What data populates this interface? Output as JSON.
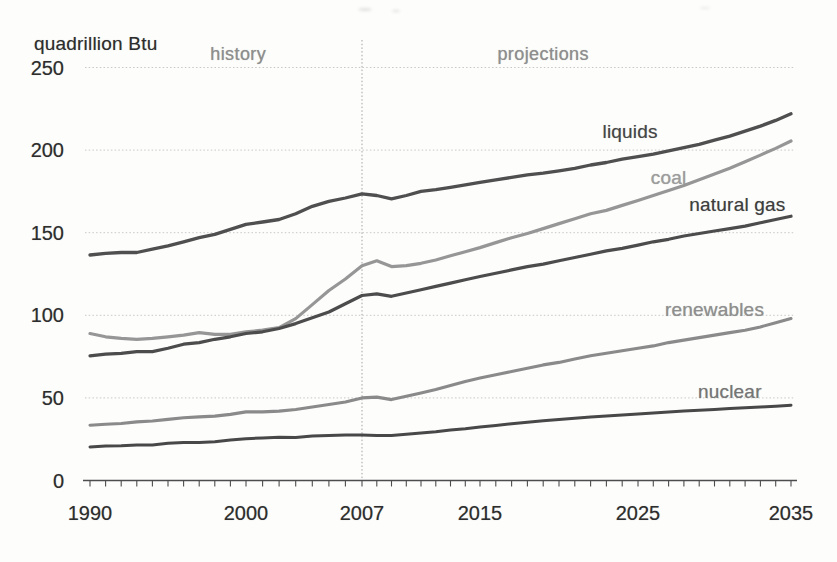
{
  "page": {
    "background": "#fdfdfc"
  },
  "chart_data": {
    "type": "line",
    "title": "quadrillion Btu",
    "unit": "quadrillion Btu",
    "x_axis": {
      "range": [
        1990,
        2035
      ],
      "tick_labels": [
        1990,
        2000,
        2007,
        2015,
        2025,
        2035
      ],
      "minor_tick_step_years": 1
    },
    "y_axis": {
      "range": [
        0,
        250
      ],
      "tick_labels": [
        0,
        50,
        100,
        150,
        200,
        250
      ],
      "gridlines": "dotted"
    },
    "annotations": {
      "history": {
        "label": "history",
        "x": 1999.5,
        "y": 258
      },
      "projections": {
        "label": "projections",
        "x": 2019,
        "y": 258
      },
      "divider_year": 2007
    },
    "colors": {
      "grid": "#c8c8c8",
      "divider": "#a3a3a3",
      "axis": "#4d4d4d",
      "axis_text": "#2d2d2d",
      "region_text": "#8e8e8e"
    },
    "series": [
      {
        "name": "liquids",
        "color": "#4f4f4f",
        "label_color": "#454545",
        "stroke_width": 3.3,
        "label": {
          "x": 2024.5,
          "y": 211
        },
        "points": [
          [
            1990,
            136.5
          ],
          [
            1991,
            137.5
          ],
          [
            1992,
            138
          ],
          [
            1993,
            138
          ],
          [
            1994,
            140
          ],
          [
            1995,
            142
          ],
          [
            1996,
            144.5
          ],
          [
            1997,
            147
          ],
          [
            1998,
            149
          ],
          [
            1999,
            152
          ],
          [
            2000,
            155
          ],
          [
            2001,
            156.5
          ],
          [
            2002,
            158
          ],
          [
            2003,
            161.5
          ],
          [
            2004,
            166
          ],
          [
            2005,
            169
          ],
          [
            2006,
            171
          ],
          [
            2007,
            173.5
          ],
          [
            2008,
            172.5
          ],
          [
            2009,
            170.5
          ],
          [
            2010,
            172.5
          ],
          [
            2011,
            175
          ],
          [
            2012,
            176
          ],
          [
            2013,
            177.5
          ],
          [
            2014,
            179
          ],
          [
            2015,
            180.5
          ],
          [
            2016,
            182
          ],
          [
            2017,
            183.5
          ],
          [
            2018,
            185
          ],
          [
            2019,
            186
          ],
          [
            2020,
            187.5
          ],
          [
            2021,
            189
          ],
          [
            2022,
            191
          ],
          [
            2023,
            192.5
          ],
          [
            2024,
            194.5
          ],
          [
            2025,
            196
          ],
          [
            2026,
            197.5
          ],
          [
            2027,
            199.5
          ],
          [
            2028,
            201.5
          ],
          [
            2029,
            203.5
          ],
          [
            2030,
            206
          ],
          [
            2031,
            208.5
          ],
          [
            2032,
            211.5
          ],
          [
            2033,
            214.5
          ],
          [
            2034,
            218
          ],
          [
            2035,
            222
          ]
        ]
      },
      {
        "name": "coal",
        "color": "#969696",
        "label_color": "#9d9d9d",
        "stroke_width": 3.2,
        "label": {
          "x": 2027,
          "y": 183
        },
        "points": [
          [
            1990,
            89
          ],
          [
            1991,
            87
          ],
          [
            1992,
            86
          ],
          [
            1993,
            85.5
          ],
          [
            1994,
            86
          ],
          [
            1995,
            87
          ],
          [
            1996,
            88
          ],
          [
            1997,
            89.5
          ],
          [
            1998,
            88.5
          ],
          [
            1999,
            88.5
          ],
          [
            2000,
            90
          ],
          [
            2001,
            91
          ],
          [
            2002,
            92.5
          ],
          [
            2003,
            98
          ],
          [
            2004,
            106.5
          ],
          [
            2005,
            115
          ],
          [
            2006,
            122
          ],
          [
            2007,
            130
          ],
          [
            2008,
            133
          ],
          [
            2009,
            129.5
          ],
          [
            2010,
            130
          ],
          [
            2011,
            131.5
          ],
          [
            2012,
            133.5
          ],
          [
            2013,
            136
          ],
          [
            2014,
            138.5
          ],
          [
            2015,
            141
          ],
          [
            2016,
            144
          ],
          [
            2017,
            147
          ],
          [
            2018,
            149.5
          ],
          [
            2019,
            152.5
          ],
          [
            2020,
            155.5
          ],
          [
            2021,
            158.5
          ],
          [
            2022,
            161.5
          ],
          [
            2023,
            163.5
          ],
          [
            2024,
            166.5
          ],
          [
            2025,
            169.5
          ],
          [
            2026,
            172.5
          ],
          [
            2027,
            175.5
          ],
          [
            2028,
            178.5
          ],
          [
            2029,
            182
          ],
          [
            2030,
            185.5
          ],
          [
            2031,
            189
          ],
          [
            2032,
            193
          ],
          [
            2033,
            197
          ],
          [
            2034,
            201
          ],
          [
            2035,
            205.5
          ]
        ]
      },
      {
        "name": "natural gas",
        "color": "#4c4c4c",
        "label_color": "#3d3d3d",
        "stroke_width": 3.2,
        "label": {
          "x": 2031.5,
          "y": 166.5
        },
        "points": [
          [
            1990,
            75.5
          ],
          [
            1991,
            76.5
          ],
          [
            1992,
            77
          ],
          [
            1993,
            78
          ],
          [
            1994,
            78
          ],
          [
            1995,
            80
          ],
          [
            1996,
            82.5
          ],
          [
            1997,
            83.5
          ],
          [
            1998,
            85.5
          ],
          [
            1999,
            87
          ],
          [
            2000,
            89
          ],
          [
            2001,
            90
          ],
          [
            2002,
            92
          ],
          [
            2003,
            95
          ],
          [
            2004,
            98.5
          ],
          [
            2005,
            102
          ],
          [
            2006,
            107
          ],
          [
            2007,
            112
          ],
          [
            2008,
            113
          ],
          [
            2009,
            111.5
          ],
          [
            2010,
            113.5
          ],
          [
            2011,
            115.5
          ],
          [
            2012,
            117.5
          ],
          [
            2013,
            119.5
          ],
          [
            2014,
            121.5
          ],
          [
            2015,
            123.5
          ],
          [
            2016,
            125.5
          ],
          [
            2017,
            127.5
          ],
          [
            2018,
            129.5
          ],
          [
            2019,
            131
          ],
          [
            2020,
            133
          ],
          [
            2021,
            135
          ],
          [
            2022,
            137
          ],
          [
            2023,
            139
          ],
          [
            2024,
            140.5
          ],
          [
            2025,
            142.5
          ],
          [
            2026,
            144.5
          ],
          [
            2027,
            146
          ],
          [
            2028,
            148
          ],
          [
            2029,
            149.5
          ],
          [
            2030,
            151
          ],
          [
            2031,
            152.5
          ],
          [
            2032,
            154
          ],
          [
            2033,
            156
          ],
          [
            2034,
            158
          ],
          [
            2035,
            160
          ]
        ]
      },
      {
        "name": "renewables",
        "color": "#8a8a8a",
        "label_color": "#8f8f8f",
        "stroke_width": 3.1,
        "label": {
          "x": 2030,
          "y": 103.5
        },
        "points": [
          [
            1990,
            33.5
          ],
          [
            1991,
            34
          ],
          [
            1992,
            34.5
          ],
          [
            1993,
            35.5
          ],
          [
            1994,
            36
          ],
          [
            1995,
            37
          ],
          [
            1996,
            38
          ],
          [
            1997,
            38.5
          ],
          [
            1998,
            39
          ],
          [
            1999,
            40
          ],
          [
            2000,
            41.5
          ],
          [
            2001,
            41.5
          ],
          [
            2002,
            42
          ],
          [
            2003,
            43
          ],
          [
            2004,
            44.5
          ],
          [
            2005,
            46
          ],
          [
            2006,
            47.5
          ],
          [
            2007,
            50
          ],
          [
            2008,
            50.5
          ],
          [
            2009,
            49
          ],
          [
            2010,
            51
          ],
          [
            2011,
            53
          ],
          [
            2012,
            55
          ],
          [
            2013,
            57.5
          ],
          [
            2014,
            60
          ],
          [
            2015,
            62
          ],
          [
            2016,
            64
          ],
          [
            2017,
            66
          ],
          [
            2018,
            68
          ],
          [
            2019,
            70
          ],
          [
            2020,
            71.5
          ],
          [
            2021,
            73.5
          ],
          [
            2022,
            75.5
          ],
          [
            2023,
            77
          ],
          [
            2024,
            78.5
          ],
          [
            2025,
            80
          ],
          [
            2026,
            81.5
          ],
          [
            2027,
            83.5
          ],
          [
            2028,
            85
          ],
          [
            2029,
            86.5
          ],
          [
            2030,
            88
          ],
          [
            2031,
            89.5
          ],
          [
            2032,
            91
          ],
          [
            2033,
            93
          ],
          [
            2034,
            95.5
          ],
          [
            2035,
            98
          ]
        ]
      },
      {
        "name": "nuclear",
        "color": "#484848",
        "label_color": "#757575",
        "stroke_width": 3.0,
        "label": {
          "x": 2031,
          "y": 53.5
        },
        "points": [
          [
            1990,
            20.3
          ],
          [
            1991,
            20.8
          ],
          [
            1992,
            21
          ],
          [
            1993,
            21.5
          ],
          [
            1994,
            21.5
          ],
          [
            1995,
            22.5
          ],
          [
            1996,
            23
          ],
          [
            1997,
            23
          ],
          [
            1998,
            23.5
          ],
          [
            1999,
            24.5
          ],
          [
            2000,
            25.3
          ],
          [
            2001,
            25.8
          ],
          [
            2002,
            26.2
          ],
          [
            2003,
            26
          ],
          [
            2004,
            27
          ],
          [
            2005,
            27.3
          ],
          [
            2006,
            27.5
          ],
          [
            2007,
            27.5
          ],
          [
            2008,
            27.3
          ],
          [
            2009,
            27.3
          ],
          [
            2010,
            28
          ],
          [
            2011,
            28.8
          ],
          [
            2012,
            29.5
          ],
          [
            2013,
            30.5
          ],
          [
            2014,
            31.3
          ],
          [
            2015,
            32.3
          ],
          [
            2016,
            33.3
          ],
          [
            2017,
            34.3
          ],
          [
            2018,
            35.3
          ],
          [
            2019,
            36.2
          ],
          [
            2020,
            37
          ],
          [
            2021,
            37.7
          ],
          [
            2022,
            38.4
          ],
          [
            2023,
            39
          ],
          [
            2024,
            39.6
          ],
          [
            2025,
            40.2
          ],
          [
            2026,
            40.8
          ],
          [
            2027,
            41.4
          ],
          [
            2028,
            42
          ],
          [
            2029,
            42.5
          ],
          [
            2030,
            43
          ],
          [
            2031,
            43.5
          ],
          [
            2032,
            44
          ],
          [
            2033,
            44.5
          ],
          [
            2034,
            45
          ],
          [
            2035,
            45.5
          ]
        ]
      }
    ]
  }
}
